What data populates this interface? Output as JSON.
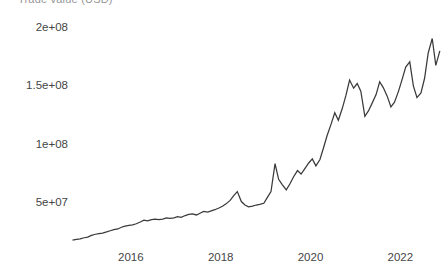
{
  "chart_data": {
    "type": "line",
    "title": "Trade value (USD)",
    "subtitle": "",
    "xlabel": "",
    "ylabel": "",
    "grid": false,
    "legend": false,
    "legend_position": "none",
    "line_color": "#3a3a3a",
    "background_color": "#ffffff",
    "text_color": "#454545",
    "xlim": [
      2014.6,
      2022.95
    ],
    "ylim": [
      16000000,
      212000000
    ],
    "x_tick_labels": [
      "2016",
      "2018",
      "2020",
      "2022"
    ],
    "x_tick_values": [
      2016,
      2018,
      2020,
      2022
    ],
    "y_tick_labels": [
      "5e+07",
      "1e+08",
      "1.5e+08",
      "2e+08"
    ],
    "y_tick_values": [
      50000000,
      100000000,
      150000000,
      200000000
    ],
    "series": [
      {
        "name": "value",
        "x": [
          2014.7,
          2014.79,
          2014.87,
          2014.96,
          2015.04,
          2015.12,
          2015.21,
          2015.29,
          2015.37,
          2015.46,
          2015.54,
          2015.62,
          2015.71,
          2015.79,
          2015.87,
          2015.96,
          2016.04,
          2016.12,
          2016.21,
          2016.29,
          2016.37,
          2016.46,
          2016.54,
          2016.62,
          2016.71,
          2016.79,
          2016.87,
          2016.96,
          2017.04,
          2017.12,
          2017.21,
          2017.29,
          2017.37,
          2017.46,
          2017.54,
          2017.62,
          2017.71,
          2017.79,
          2017.87,
          2017.96,
          2018.04,
          2018.12,
          2018.21,
          2018.29,
          2018.37,
          2018.46,
          2018.54,
          2018.62,
          2018.71,
          2018.79,
          2018.87,
          2018.96,
          2019.04,
          2019.12,
          2019.21,
          2019.29,
          2019.37,
          2019.46,
          2019.54,
          2019.62,
          2019.71,
          2019.79,
          2019.87,
          2019.96,
          2020.04,
          2020.12,
          2020.21,
          2020.29,
          2020.37,
          2020.46,
          2020.54,
          2020.62,
          2020.71,
          2020.79,
          2020.87,
          2020.96,
          2021.04,
          2021.12,
          2021.21,
          2021.29,
          2021.37,
          2021.46,
          2021.54,
          2021.62,
          2021.71,
          2021.79,
          2021.87,
          2021.96,
          2022.04,
          2022.12,
          2022.21,
          2022.29,
          2022.37,
          2022.46,
          2022.54,
          2022.62,
          2022.71,
          2022.79,
          2022.88
        ],
        "values": [
          18500000,
          19000000,
          19500000,
          20500000,
          21000000,
          22500000,
          23500000,
          24000000,
          24500000,
          25500000,
          26500000,
          27500000,
          28000000,
          29500000,
          30500000,
          31000000,
          31500000,
          32500000,
          34000000,
          35500000,
          35000000,
          36000000,
          36500000,
          36000000,
          36500000,
          37500000,
          37000000,
          37500000,
          38500000,
          38000000,
          39500000,
          40500000,
          41000000,
          40000000,
          41500000,
          43000000,
          42500000,
          43500000,
          44500000,
          46000000,
          47500000,
          49500000,
          52500000,
          56500000,
          60000000,
          51500000,
          48500000,
          47000000,
          47500000,
          48500000,
          49000000,
          50000000,
          55000000,
          60000000,
          84000000,
          70500000,
          66000000,
          61500000,
          66500000,
          72500000,
          78000000,
          75000000,
          79500000,
          84500000,
          88000000,
          82000000,
          87500000,
          97500000,
          108000000,
          118000000,
          127500000,
          121000000,
          131500000,
          142500000,
          155500000,
          148500000,
          152500000,
          146000000,
          124500000,
          129000000,
          135500000,
          143000000,
          154000000,
          149000000,
          141500000,
          132500000,
          136500000,
          146000000,
          156000000,
          166500000,
          171000000,
          150500000,
          140500000,
          144500000,
          157000000,
          178500000,
          191000000,
          168000000,
          180500000
        ]
      }
    ]
  }
}
